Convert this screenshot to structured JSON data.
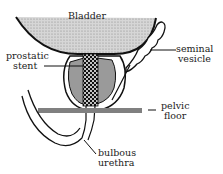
{
  "diagram": {
    "labels": {
      "bladder": "Bladder",
      "prostatic_stent_1": "prostatic",
      "prostatic_stent_2": "stent",
      "seminal_vesicle_1": "seminal",
      "seminal_vesicle_2": "vesicle",
      "pelvic_floor_1": "pelvic",
      "pelvic_floor_2": "floor",
      "bulbous_urethra_1": "bulbous",
      "bulbous_urethra_2": "urethra"
    },
    "colors": {
      "bladder_fill": "#c8c8c8",
      "prostate_fill": "#9a9a9a",
      "pelvic_floor": "#808080",
      "outline": "#111111"
    }
  }
}
